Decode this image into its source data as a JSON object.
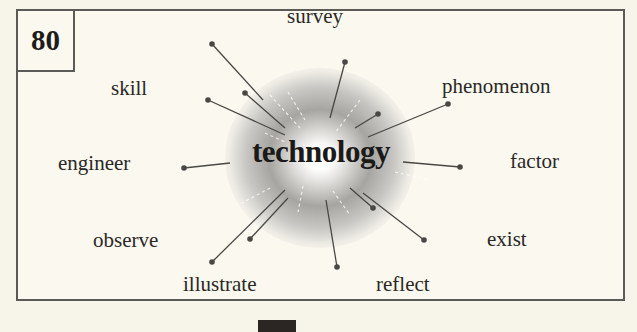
{
  "card": {
    "number": "80",
    "center_word": "technology",
    "words": [
      {
        "id": "survey",
        "text": "survey"
      },
      {
        "id": "skill",
        "text": "skill"
      },
      {
        "id": "phenomenon",
        "text": "phenomenon"
      },
      {
        "id": "engineer",
        "text": "engineer"
      },
      {
        "id": "factor",
        "text": "factor"
      },
      {
        "id": "observe",
        "text": "observe"
      },
      {
        "id": "exist",
        "text": "exist"
      },
      {
        "id": "illustrate",
        "text": "illustrate"
      },
      {
        "id": "reflect",
        "text": "reflect"
      }
    ]
  },
  "colors": {
    "background": "#f7f4e9",
    "border": "#5b5a57",
    "text": "#2a2826",
    "spoke": "#4a4845"
  }
}
